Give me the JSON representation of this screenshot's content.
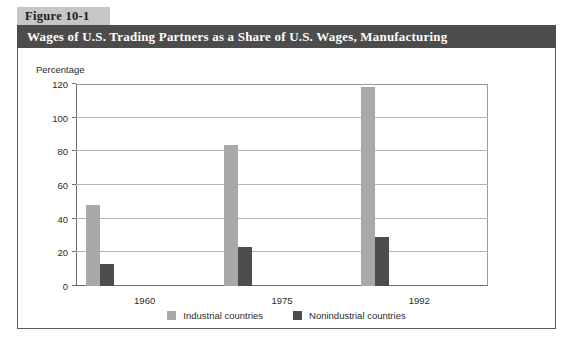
{
  "figure": {
    "number_label": "Figure 10-1",
    "title": "Wages of U.S. Trading Partners as a Share of U.S. Wages, Manufacturing"
  },
  "colors": {
    "title_bar": "#4c4c4c",
    "tab_background": "#c6c6c6",
    "industrial": "#a9a9a9",
    "nonindustrial": "#4d4d4d",
    "gridline": "#b4b4b4",
    "panel_border": "#5a5a5a"
  },
  "chart_data": {
    "type": "bar",
    "title": "Wages of U.S. Trading Partners as a Share of U.S. Wages, Manufacturing",
    "categories": [
      "1960",
      "1975",
      "1992"
    ],
    "series": [
      {
        "name": "Industrial countries",
        "color": "#a9a9a9",
        "values": [
          48,
          84,
          118
        ]
      },
      {
        "name": "Nonindustrial countries",
        "color": "#4d4d4d",
        "values": [
          13,
          23,
          29
        ]
      }
    ],
    "xlabel": "",
    "ylabel": "Percentage",
    "ylim": [
      0,
      120
    ],
    "yticks": [
      0,
      20,
      40,
      60,
      80,
      100,
      120
    ],
    "ytick_labels": [
      "0",
      "20",
      "40",
      "60",
      "80",
      "100",
      "120"
    ],
    "grid": true,
    "legend_position": "bottom-center"
  }
}
